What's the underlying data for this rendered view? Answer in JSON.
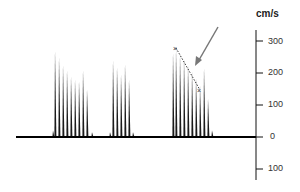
{
  "chart_data": {
    "type": "bar",
    "title": "",
    "ylabel": "cm/s",
    "xlabel": "",
    "ylim": [
      -100,
      300
    ],
    "y_ticks": [
      300,
      200,
      100,
      0,
      -100
    ],
    "y_tick_labels": [
      "300",
      "200",
      "100",
      "0",
      "100"
    ],
    "grid": false,
    "legend": [],
    "series": [
      {
        "name": "cycle-1",
        "x": [
          53,
          55,
          59,
          63,
          67,
          71,
          75,
          79,
          83,
          87,
          92
        ],
        "values": [
          20,
          270,
          250,
          225,
          210,
          190,
          180,
          175,
          210,
          150,
          15
        ]
      },
      {
        "name": "cycle-2",
        "x": [
          110,
          113,
          117,
          121,
          125,
          129,
          133
        ],
        "values": [
          15,
          240,
          220,
          195,
          230,
          180,
          15
        ]
      },
      {
        "name": "cycle-3",
        "x": [
          173,
          176,
          180,
          184,
          188,
          192,
          196,
          200,
          204,
          208,
          212
        ],
        "values": [
          265,
          275,
          260,
          245,
          225,
          205,
          185,
          160,
          215,
          120,
          20
        ]
      }
    ],
    "annotations": [
      {
        "type": "marker",
        "symbol": "x",
        "at_value": 280,
        "x": 176
      },
      {
        "type": "dotted-line",
        "from_value": 280,
        "to_value": 150,
        "description": "deceleration slope"
      },
      {
        "type": "marker",
        "symbol": "x",
        "at_value": 150,
        "x": 200
      },
      {
        "type": "arrow",
        "description": "grey arrow pointing to slope"
      }
    ]
  },
  "axis": {
    "unit_label": "cm/s",
    "tick_labels": [
      "300",
      "200",
      "100",
      "0",
      "100"
    ]
  }
}
